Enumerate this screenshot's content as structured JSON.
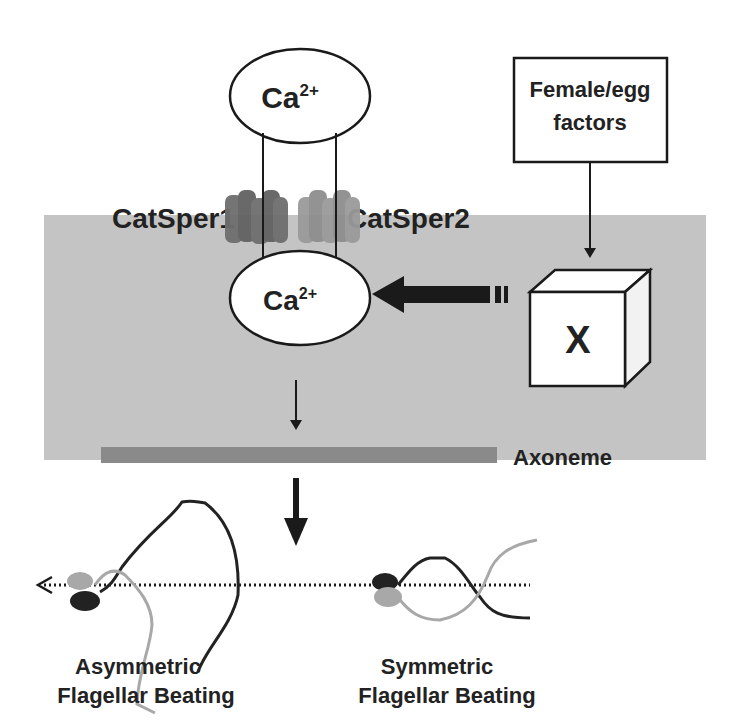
{
  "diagram": {
    "extracellular_calcium": {
      "base": "Ca",
      "superscript": "2+"
    },
    "intracellular_calcium": {
      "base": "Ca",
      "superscript": "2+"
    },
    "channels": [
      {
        "label": "CatSper1",
        "color": "#6e6e6e"
      },
      {
        "label": "CatSper2",
        "color": "#9a9a9a"
      }
    ],
    "signal_source": {
      "line1": "Female/egg",
      "line2": "factors"
    },
    "unknown_factor": {
      "label": "X"
    },
    "axoneme": {
      "label": "Axoneme",
      "color": "#8a8a8a"
    },
    "outcomes": [
      {
        "line1": "Asymmetric",
        "line2": "Flagellar Beating"
      },
      {
        "line1": "Symmetric",
        "line2": "Flagellar Beating"
      }
    ],
    "colors": {
      "cell_background": "#c4c4c4",
      "arrow": "#1a1a1a",
      "flagellum_dark": "#222222",
      "flagellum_light": "#a8a8a8"
    }
  }
}
